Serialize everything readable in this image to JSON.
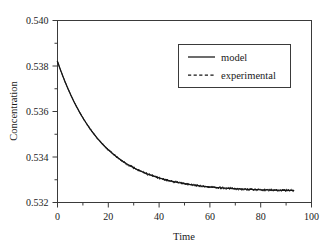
{
  "chart_data": {
    "type": "line",
    "title": "",
    "xlabel": "Time",
    "ylabel": "Concentration",
    "xlim": [
      0,
      100
    ],
    "ylim": [
      0.532,
      0.54
    ],
    "x_major_ticks": [
      0,
      20,
      40,
      60,
      80,
      100
    ],
    "x_minor_ticks": [
      10,
      30,
      50,
      70,
      90
    ],
    "x_tick_labels": [
      "0",
      "20",
      "40",
      "60",
      "80",
      "100"
    ],
    "y_major_ticks": [
      0.532,
      0.534,
      0.536,
      0.538,
      0.54
    ],
    "y_minor_ticks": [
      0.533,
      0.535,
      0.537,
      0.539
    ],
    "y_tick_labels": [
      "0.532",
      "0.534",
      "0.536",
      "0.538",
      "0.540"
    ],
    "grid": false,
    "legend_position": "top-right",
    "legend_entries": [
      {
        "name": "model",
        "style": "solid"
      },
      {
        "name": "experimental",
        "style": "dashed"
      }
    ],
    "series": [
      {
        "name": "model",
        "style": "solid",
        "color": "#141414",
        "description": "exponential decay from 0.53820 at t=0 to plateau 0.53250",
        "model": {
          "y0": 0.5382,
          "yinf": 0.5325,
          "tau": 17.5,
          "t_start": 0,
          "t_end": 93
        },
        "x": [
          0,
          2,
          4,
          6,
          8,
          10,
          12,
          14,
          16,
          18,
          20,
          24,
          28,
          32,
          36,
          40,
          44,
          48,
          52,
          56,
          60,
          64,
          68,
          72,
          76,
          80,
          84,
          88,
          93
        ],
        "values": [
          0.5382,
          0.53759,
          0.53705,
          0.53657,
          0.53614,
          0.53576,
          0.53542,
          0.53512,
          0.53485,
          0.53461,
          0.5344,
          0.53404,
          0.53376,
          0.53353,
          0.53335,
          0.53321,
          0.5331,
          0.533,
          0.53293,
          0.53287,
          0.53282,
          0.53278,
          0.53275,
          0.53272,
          0.5327,
          0.53268,
          0.53266,
          0.53265,
          0.53263
        ]
      },
      {
        "name": "experimental",
        "style": "dashed",
        "color": "#141414",
        "description": "noisy measured data following the model curve from t=0 to t=93",
        "noise_amplitude": 6e-05,
        "x": [
          0,
          2,
          4,
          6,
          8,
          10,
          12,
          14,
          16,
          18,
          20,
          24,
          28,
          32,
          36,
          40,
          44,
          48,
          52,
          56,
          60,
          64,
          68,
          72,
          76,
          80,
          84,
          88,
          93
        ],
        "values": [
          0.53822,
          0.53755,
          0.53709,
          0.53652,
          0.53618,
          0.53572,
          0.53546,
          0.53508,
          0.53489,
          0.53457,
          0.53444,
          0.534,
          0.5338,
          0.53349,
          0.53339,
          0.53317,
          0.53314,
          0.53296,
          0.53297,
          0.53283,
          0.53286,
          0.53274,
          0.53279,
          0.53268,
          0.53274,
          0.53264,
          0.5327,
          0.53261,
          0.53267
        ]
      }
    ]
  },
  "figure": {
    "background": "#ffffff",
    "axis_color": "#3a3a3a",
    "line_color": "#141414"
  }
}
